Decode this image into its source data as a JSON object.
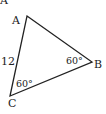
{
  "diagram": {
    "type": "triangle",
    "vertices": {
      "A": {
        "label": "A",
        "x": 27,
        "y": 16
      },
      "B": {
        "label": "B",
        "x": 92,
        "y": 62
      },
      "C": {
        "label": "C",
        "x": 10,
        "y": 96
      }
    },
    "top_partial_label": "A",
    "side_AC_label": "12",
    "angle_B_label": "60°",
    "angle_C_label": "60°",
    "stroke_color": "#222222"
  }
}
